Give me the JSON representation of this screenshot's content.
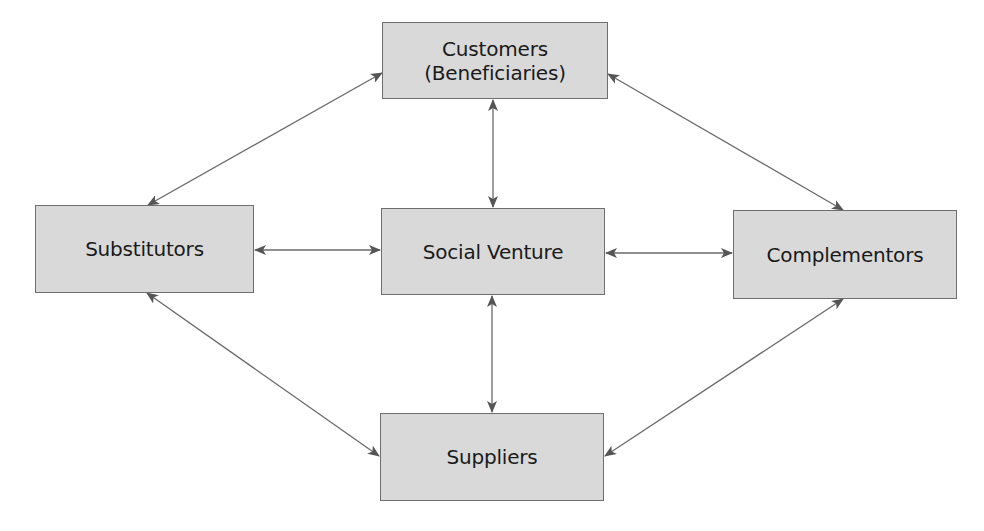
{
  "diagram": {
    "type": "network",
    "nodes": [
      {
        "id": "customers",
        "lines": [
          "Customers",
          "(Beneficiaries)"
        ]
      },
      {
        "id": "substitutors",
        "label": "Substitutors"
      },
      {
        "id": "social_venture",
        "label": "Social Venture"
      },
      {
        "id": "complementors",
        "label": "Complementors"
      },
      {
        "id": "suppliers",
        "label": "Suppliers"
      }
    ],
    "edges": [
      {
        "from": "customers",
        "to": "social_venture",
        "bidirectional": true
      },
      {
        "from": "substitutors",
        "to": "social_venture",
        "bidirectional": true
      },
      {
        "from": "social_venture",
        "to": "complementors",
        "bidirectional": true
      },
      {
        "from": "social_venture",
        "to": "suppliers",
        "bidirectional": true
      },
      {
        "from": "customers",
        "to": "substitutors",
        "bidirectional": true
      },
      {
        "from": "customers",
        "to": "complementors",
        "bidirectional": true
      },
      {
        "from": "substitutors",
        "to": "suppliers",
        "bidirectional": true
      },
      {
        "from": "complementors",
        "to": "suppliers",
        "bidirectional": true
      }
    ],
    "colors": {
      "box_fill": "#d9d9d9",
      "box_border": "#6e6e6e",
      "arrow": "#555555",
      "text": "#1a1a1a"
    }
  },
  "nodes": {
    "customers": {
      "line1": "Customers",
      "line2": "(Beneficiaries)"
    },
    "substitutors": "Substitutors",
    "social_venture": "Social Venture",
    "complementors": "Complementors",
    "suppliers": "Suppliers"
  }
}
